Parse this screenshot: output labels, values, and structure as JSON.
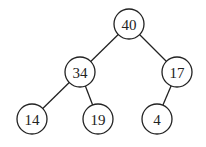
{
  "diagram": {
    "type": "binary-tree",
    "nodes": [
      {
        "id": "n40",
        "label": "40",
        "x": 129,
        "y": 24
      },
      {
        "id": "n34",
        "label": "34",
        "x": 80,
        "y": 72
      },
      {
        "id": "n17",
        "label": "17",
        "x": 177,
        "y": 72
      },
      {
        "id": "n14",
        "label": "14",
        "x": 32,
        "y": 119
      },
      {
        "id": "n19",
        "label": "19",
        "x": 98,
        "y": 119
      },
      {
        "id": "n4",
        "label": "4",
        "x": 157,
        "y": 119
      }
    ],
    "edges": [
      [
        "n40",
        "n34"
      ],
      [
        "n40",
        "n17"
      ],
      [
        "n34",
        "n14"
      ],
      [
        "n34",
        "n19"
      ],
      [
        "n17",
        "n4"
      ]
    ],
    "radius": 15
  }
}
